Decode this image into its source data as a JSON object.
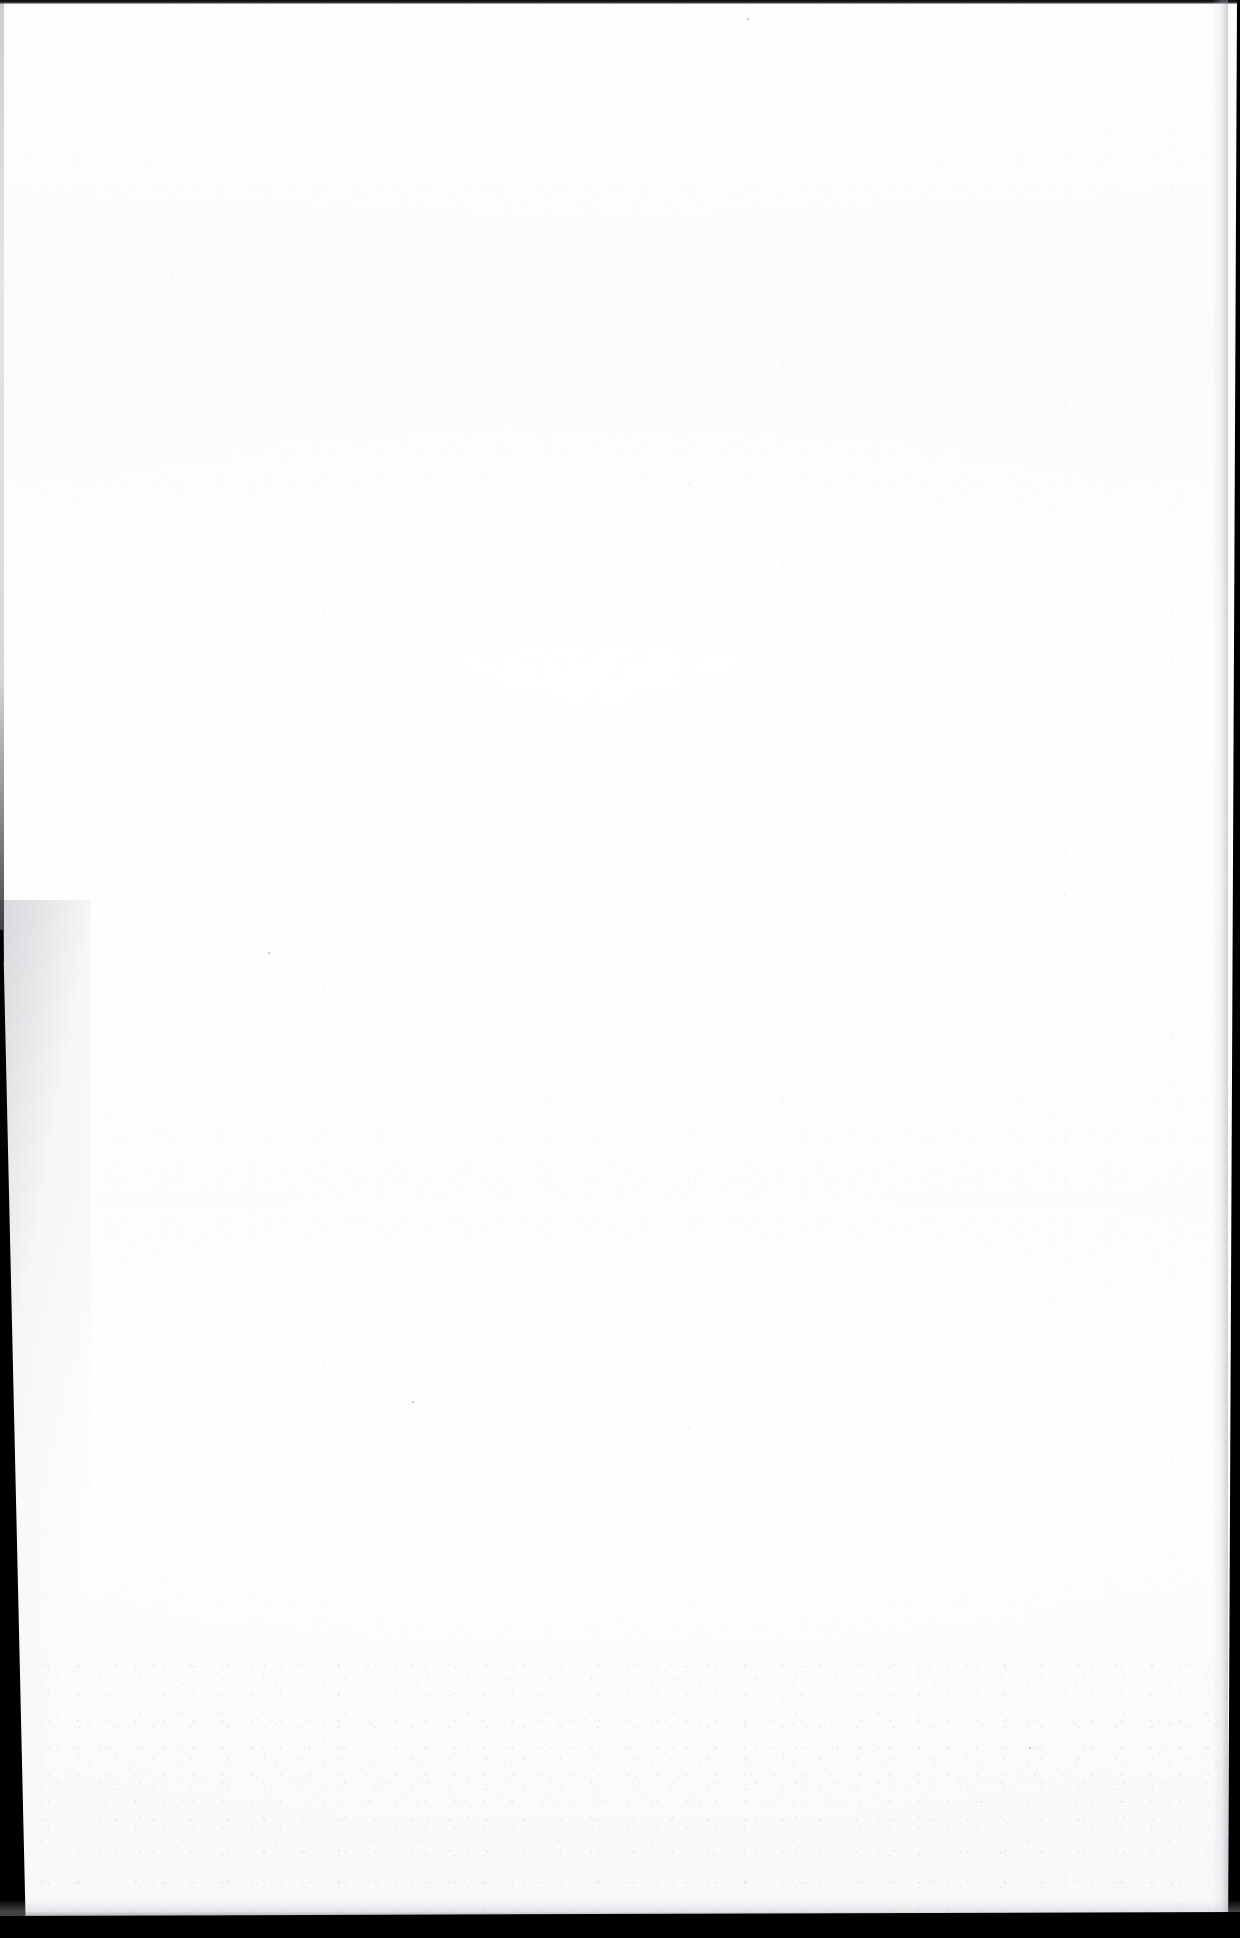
{
  "document": {
    "kind": "scanned-page",
    "page_content": "",
    "page_note": "blank page",
    "width_px": 1240,
    "height_px": 1938
  },
  "page": {
    "background_color": "#ffffff",
    "paper_tone": "#fdfdfe",
    "has_text": false,
    "has_figures": false,
    "has_page_number": false
  },
  "scan_artifacts": {
    "top_edge": {
      "label": "top-edge-rule",
      "color": "#0b0c0e",
      "thickness_px": 4
    },
    "left_gutter": {
      "label": "left-gutter-wedge",
      "color": "#000000",
      "starts_at_y_px": 930,
      "width_top_px": 3,
      "width_bottom_px": 26
    },
    "right_edge": {
      "label": "right-edge-band",
      "color": "#000000",
      "width_top_px": 3,
      "width_bottom_px": 12
    },
    "bottom_edge": {
      "label": "bottom-edge-band",
      "color": "#000000",
      "height_px": 24
    },
    "grain": {
      "label": "paper-grain",
      "description": "faint speckle texture",
      "tint": "#787d87"
    }
  },
  "specks": [
    {
      "x": 412,
      "y": 1401,
      "size": 2
    },
    {
      "x": 747,
      "y": 18,
      "size": 2
    },
    {
      "x": 1029,
      "y": 1747,
      "size": 2
    },
    {
      "x": 268,
      "y": 952,
      "size": 2
    }
  ]
}
